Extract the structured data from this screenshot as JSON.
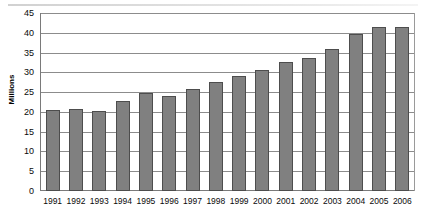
{
  "chart_data": {
    "type": "bar",
    "title": "",
    "xlabel": "",
    "ylabel": "Millions",
    "ylim": [
      0,
      45
    ],
    "yticks": [
      0,
      5,
      10,
      15,
      20,
      25,
      30,
      35,
      40,
      45
    ],
    "grid": true,
    "legend": false,
    "bar_color": "#808080",
    "bar_edge_color": "#4d4d4d",
    "categories": [
      "1991",
      "1992",
      "1993",
      "1994",
      "1995",
      "1996",
      "1997",
      "1998",
      "1999",
      "2000",
      "2001",
      "2002",
      "2003",
      "2004",
      "2005",
      "2006"
    ],
    "values": [
      20.5,
      20.8,
      20.2,
      22.7,
      24.8,
      24.0,
      25.8,
      27.6,
      29.0,
      30.5,
      32.6,
      33.6,
      36.0,
      39.6,
      41.5,
      41.4
    ]
  }
}
